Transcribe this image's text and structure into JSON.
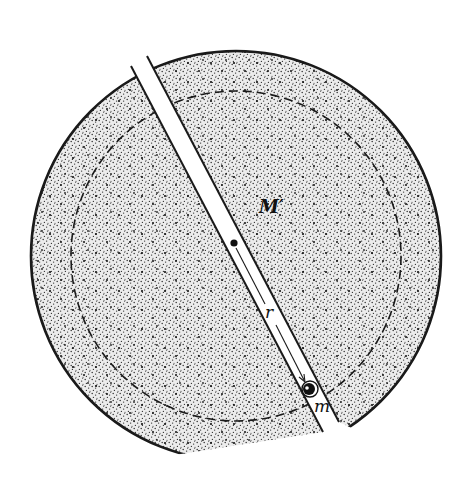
{
  "figure": {
    "labels": {
      "enclosed_mass": "M′",
      "radius": "r",
      "test_mass": "m"
    },
    "colors": {
      "stroke": "#1a1a1a",
      "stipple": "#2a2a2a",
      "fill_light": "#e9e9e9",
      "background": "#ffffff"
    },
    "geometry": {
      "outer_radius_px": 205,
      "inner_dashed_radius_px": 165,
      "center": [
        236,
        256
      ],
      "tunnel_center_dot": [
        234,
        243
      ],
      "mass_position": [
        309,
        389
      ]
    }
  }
}
